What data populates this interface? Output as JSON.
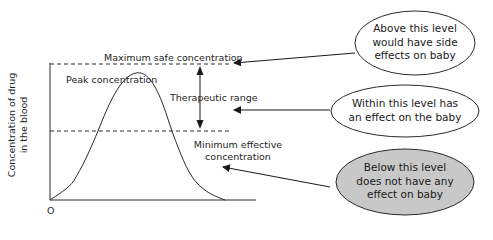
{
  "diagram": {
    "axes": {
      "y_label_line1": "Concentration of drug",
      "y_label_line2": "in the blood",
      "origin_label": "O"
    },
    "levels": {
      "max_safe": "Maximum safe concentration",
      "peak": "Peak concentration",
      "therapeutic": "Therapeutic range",
      "min_effective_line1": "Minimum effective",
      "min_effective_line2": "concentration"
    },
    "callouts": [
      {
        "id": "above",
        "lines": [
          "Above this level",
          "would have side",
          "effects on baby"
        ],
        "fill": "#ffffff"
      },
      {
        "id": "within",
        "lines": [
          "Within this level has",
          "an effect on the baby"
        ],
        "fill": "#ffffff"
      },
      {
        "id": "below",
        "lines": [
          "Below this level",
          "does not have any",
          "effect on baby"
        ],
        "fill": "#c8c8c8"
      }
    ],
    "colors": {
      "line": "#2a2a2a",
      "shaded_bubble": "#c8c8c8",
      "background": "#ffffff"
    }
  }
}
